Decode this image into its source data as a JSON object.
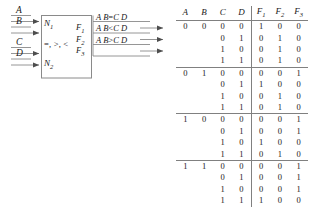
{
  "diagram": {
    "inputs": [
      {
        "label": "A",
        "name": "input-a"
      },
      {
        "label": "B",
        "name": "input-b"
      },
      {
        "label": "C",
        "name": "input-c"
      },
      {
        "label": "D",
        "name": "input-d"
      }
    ],
    "block": {
      "operand_top": "N",
      "operand_top_sub": "1",
      "operand_bottom": "N",
      "operand_bottom_sub": "2",
      "operations": "=, >, <"
    },
    "outputs": [
      {
        "pin": "F",
        "pin_sub": "1",
        "left": "A B",
        "op": "=",
        "right": "C D",
        "name": "output-f1"
      },
      {
        "pin": "F",
        "pin_sub": "2",
        "left": "A B",
        "op": "<",
        "right": "C D",
        "name": "output-f2"
      },
      {
        "pin": "F",
        "pin_sub": "3",
        "left": "A B",
        "op": ">",
        "right": "C D",
        "name": "output-f3"
      }
    ]
  },
  "truth_table": {
    "headers": [
      {
        "base": "A",
        "sub": ""
      },
      {
        "base": "B",
        "sub": ""
      },
      {
        "base": "C",
        "sub": ""
      },
      {
        "base": "D",
        "sub": ""
      },
      {
        "base": "F",
        "sub": "1"
      },
      {
        "base": "F",
        "sub": "2"
      },
      {
        "base": "F",
        "sub": "3"
      }
    ],
    "groups": [
      {
        "ab": [
          "0",
          "0"
        ],
        "rows": [
          {
            "cd": [
              "0",
              "0"
            ],
            "f": [
              "1",
              "0",
              "0"
            ]
          },
          {
            "cd": [
              "0",
              "1"
            ],
            "f": [
              "0",
              "1",
              "0"
            ]
          },
          {
            "cd": [
              "1",
              "0"
            ],
            "f": [
              "0",
              "1",
              "0"
            ]
          },
          {
            "cd": [
              "1",
              "1"
            ],
            "f": [
              "0",
              "1",
              "0"
            ]
          }
        ]
      },
      {
        "ab": [
          "0",
          "1"
        ],
        "rows": [
          {
            "cd": [
              "0",
              "0"
            ],
            "f": [
              "0",
              "0",
              "1"
            ]
          },
          {
            "cd": [
              "0",
              "1"
            ],
            "f": [
              "1",
              "0",
              "0"
            ]
          },
          {
            "cd": [
              "1",
              "0"
            ],
            "f": [
              "0",
              "1",
              "0"
            ]
          },
          {
            "cd": [
              "1",
              "1"
            ],
            "f": [
              "0",
              "1",
              "0"
            ]
          }
        ]
      },
      {
        "ab": [
          "1",
          "0"
        ],
        "rows": [
          {
            "cd": [
              "0",
              "0"
            ],
            "f": [
              "0",
              "0",
              "1"
            ]
          },
          {
            "cd": [
              "0",
              "1"
            ],
            "f": [
              "0",
              "0",
              "1"
            ]
          },
          {
            "cd": [
              "1",
              "0"
            ],
            "f": [
              "1",
              "0",
              "0"
            ]
          },
          {
            "cd": [
              "1",
              "1"
            ],
            "f": [
              "0",
              "1",
              "0"
            ]
          }
        ]
      },
      {
        "ab": [
          "1",
          "1"
        ],
        "rows": [
          {
            "cd": [
              "0",
              "0"
            ],
            "f": [
              "0",
              "0",
              "1"
            ]
          },
          {
            "cd": [
              "0",
              "1"
            ],
            "f": [
              "0",
              "0",
              "1"
            ]
          },
          {
            "cd": [
              "1",
              "0"
            ],
            "f": [
              "0",
              "0",
              "1"
            ]
          },
          {
            "cd": [
              "1",
              "1"
            ],
            "f": [
              "1",
              "0",
              "0"
            ]
          }
        ]
      }
    ]
  },
  "style": {
    "line_color": "#808080",
    "text_color": "#1a1a1a",
    "background": "#ffffff"
  }
}
